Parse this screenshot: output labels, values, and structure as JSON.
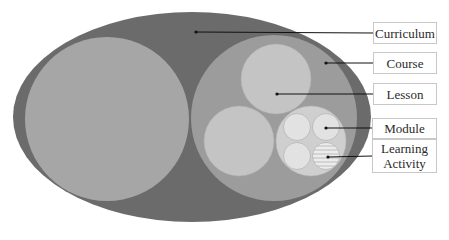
{
  "diagram": {
    "colors": {
      "curriculum": "#6b6b6b",
      "course": "#9a9a9a",
      "lesson": "#bdbdbd",
      "module": "#d2d2d2",
      "learning_activity": "#e6e6e6",
      "leader_line": "#111111",
      "label_border": "#c8c8c8"
    },
    "labels": [
      {
        "id": "curriculum",
        "text": "Curriculum"
      },
      {
        "id": "course",
        "text": "Course"
      },
      {
        "id": "lesson",
        "text": "Lesson"
      },
      {
        "id": "module",
        "text": "Module"
      },
      {
        "id": "learning-activity",
        "text": "Learning Activity",
        "lines": [
          "Learning",
          "Activity"
        ]
      }
    ],
    "hierarchy": [
      "Curriculum",
      "Course",
      "Lesson",
      "Module",
      "Learning Activity"
    ]
  }
}
